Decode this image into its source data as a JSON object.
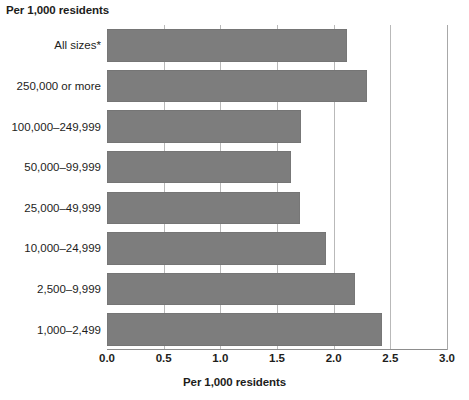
{
  "chart_data": {
    "type": "bar",
    "orientation": "horizontal",
    "title": "",
    "top_left_label": "Per 1,000 residents",
    "xlabel": "Per 1,000 residents",
    "ylabel": "",
    "xlim": [
      0.0,
      3.0
    ],
    "xticks": [
      "0.0",
      "0.5",
      "1.0",
      "1.5",
      "2.0",
      "2.5",
      "3.0"
    ],
    "xtick_values": [
      0.0,
      0.5,
      1.0,
      1.5,
      2.0,
      2.5,
      3.0
    ],
    "grid": true,
    "grid_axis": "x",
    "legend": false,
    "bar_color": "#7d7d7d",
    "categories": [
      "All sizes*",
      "250,000 or more",
      "100,000–249,999",
      "50,000–99,999",
      "25,000–49,999",
      "10,000–24,999",
      "2,500–9,999",
      "1,000–2,499"
    ],
    "values": [
      2.12,
      2.29,
      1.71,
      1.62,
      1.7,
      1.93,
      2.19,
      2.43
    ]
  }
}
